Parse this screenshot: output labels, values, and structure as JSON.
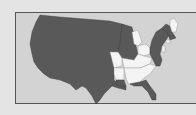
{
  "map": {
    "type": "us-states-choropleth",
    "colors": {
      "background": "#e4e4e4",
      "frame": "#d3d3d3",
      "highlighted": "#595959",
      "not_highlighted": "#f4f4f4"
    },
    "highlighted_legend": "dark",
    "unshaded_states": [
      "Maine",
      "Michigan",
      "Ohio",
      "Missouri",
      "Kentucky",
      "Tennessee",
      "Arkansas",
      "Mississippi",
      "Alabama",
      "Georgia",
      "South Carolina",
      "Connecticut",
      "New Jersey"
    ]
  }
}
